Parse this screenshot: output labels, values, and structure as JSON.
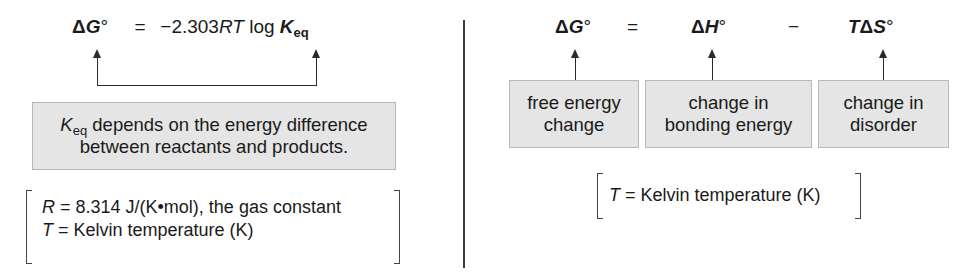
{
  "left_panel": {
    "equation": {
      "lhs_delta": "Δ",
      "lhs_symbol": "G",
      "lhs_degree": "°",
      "equals": "=",
      "coefficient": "−2.303",
      "rt": "RT",
      "log": "log",
      "k_symbol": "K",
      "k_subscript": "eq"
    },
    "explanation_box": {
      "k_symbol": "K",
      "k_subscript": "eq",
      "line1_rest": " depends on the energy difference",
      "line2": "between reactants and products."
    },
    "definitions": [
      {
        "symbol": "R",
        "text": " = 8.314 J/(K•mol), the gas constant"
      },
      {
        "symbol": "T",
        "text": " = Kelvin temperature (K)"
      }
    ]
  },
  "right_panel": {
    "equation": {
      "term1_delta": "Δ",
      "term1_symbol": "G",
      "term1_degree": "°",
      "equals": "=",
      "term2_delta": "Δ",
      "term2_symbol": "H",
      "term2_degree": "°",
      "minus": "−",
      "term3_t": "T",
      "term3_delta": "Δ",
      "term3_symbol": "S",
      "term3_degree": "°"
    },
    "label_boxes": [
      {
        "line1": "free energy",
        "line2": "change"
      },
      {
        "line1": "change in",
        "line2": "bonding energy"
      },
      {
        "line1": "change in",
        "line2": "disorder"
      }
    ],
    "definition": {
      "symbol": "T",
      "text": " = Kelvin temperature (K)"
    }
  },
  "colors": {
    "box_fill": "#e5e5e5",
    "box_border": "#b9b9b9",
    "line": "#2a2a2a",
    "text": "#1a1a1a"
  }
}
